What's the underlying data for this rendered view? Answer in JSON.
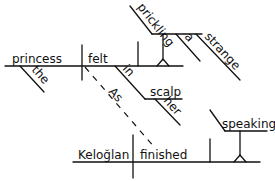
{
  "diagram": {
    "type": "sentence-diagram",
    "main_clause": {
      "subject": "princess",
      "subject_modifier": "the",
      "verb": "felt",
      "prepositional_phrase": {
        "preposition": "in",
        "object": "scalp",
        "object_modifier": "her"
      },
      "complement": {
        "word": "prickling",
        "modifiers": [
          "a",
          "strange"
        ]
      }
    },
    "subordinate_clause": {
      "conjunction": "As",
      "subject": "Keloğlan",
      "verb": "finished",
      "object": {
        "word": "speaking"
      }
    }
  }
}
